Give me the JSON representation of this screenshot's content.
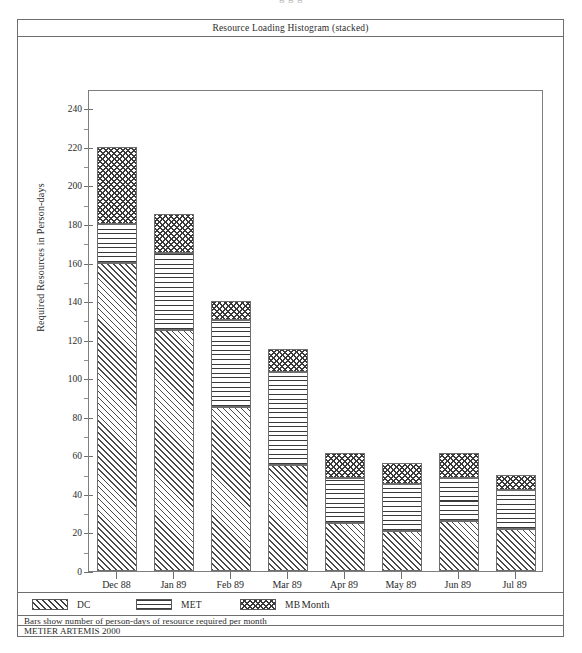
{
  "top_cut_text": "g                                        g          g",
  "report": {
    "title": "Resource Loading Histogram  (stacked)",
    "footer_note": "Bars show number of person-days of resource required per month",
    "footer_brand": "METIER ARTEMIS 2000"
  },
  "legend": {
    "entries": [
      {
        "key": "dc",
        "label": "DC",
        "pattern": "diagonal-hatch"
      },
      {
        "key": "met",
        "label": "MET",
        "pattern": "horizontal-lines"
      },
      {
        "key": "mb",
        "label": "MB",
        "pattern": "checkerboard"
      }
    ]
  },
  "chart_data": {
    "type": "bar",
    "stacked": true,
    "title": "Resource Loading Histogram  (stacked)",
    "xlabel": "Month",
    "ylabel": "Required Resources in Person-days",
    "categories": [
      "Dec 88",
      "Jan 89",
      "Feb 89",
      "Mar 89",
      "Apr 89",
      "May 89",
      "Jun 89",
      "Jul 89"
    ],
    "series": [
      {
        "name": "DC",
        "values": [
          160,
          125,
          85,
          55,
          25,
          21,
          26,
          22
        ]
      },
      {
        "name": "MET",
        "values": [
          20,
          40,
          45,
          48,
          23,
          24,
          22,
          20
        ]
      },
      {
        "name": "MB",
        "values": [
          40,
          20,
          10,
          12,
          13,
          11,
          13,
          8
        ]
      }
    ],
    "totals": [
      220,
      185,
      140,
      115,
      61,
      56,
      61,
      50
    ],
    "ylim": [
      0,
      250
    ],
    "ytick_major": [
      0,
      20,
      40,
      60,
      80,
      100,
      120,
      140,
      160,
      180,
      200,
      220,
      240
    ],
    "ytick_minor_step": 10,
    "ytick_labels": [
      "0",
      "20",
      "40",
      "60",
      "80",
      "100",
      "120",
      "140",
      "160",
      "180",
      "200",
      "220",
      "240"
    ],
    "grid": false,
    "legend_position": "below-plot"
  }
}
